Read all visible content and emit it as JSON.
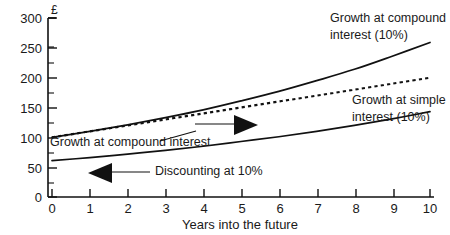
{
  "chart_data": {
    "type": "line",
    "title": "",
    "xlabel": "Years into the future",
    "ylabel": "£",
    "xlim": [
      0,
      10
    ],
    "ylim": [
      0,
      300
    ],
    "grid": false,
    "legend_position": "inline-annotations",
    "x": [
      0,
      1,
      2,
      3,
      4,
      5,
      6,
      7,
      8,
      9,
      10
    ],
    "xticks": [
      "0",
      "1",
      "2",
      "3",
      "4",
      "5",
      "6",
      "7",
      "8",
      "9",
      "10"
    ],
    "yticks": [
      "0",
      "50",
      "100",
      "150",
      "200",
      "250",
      "300"
    ],
    "ytick_values": [
      0,
      50,
      100,
      150,
      200,
      250,
      300
    ],
    "yminor_step": 25,
    "series": [
      {
        "name": "Growth at compound interest (10%)",
        "style": "solid",
        "values": [
          100,
          110,
          121,
          133,
          146,
          161,
          177,
          195,
          214,
          236,
          259
        ]
      },
      {
        "name": "Growth at simple interest (10%)",
        "style": "dotted",
        "values": [
          100,
          110,
          120,
          130,
          140,
          150,
          160,
          170,
          180,
          190,
          200
        ]
      },
      {
        "name": "Discounting at 10%",
        "style": "solid",
        "values": [
          61,
          66,
          72,
          78,
          85,
          93,
          101,
          110,
          120,
          131,
          143
        ]
      }
    ],
    "annotations": [
      {
        "id": "label-compound-right",
        "text_lines": [
          "Growth at compound",
          "interest (10%)"
        ],
        "x": 330,
        "y": 22
      },
      {
        "id": "label-simple-right",
        "text_lines": [
          "Growth at simple",
          "interest (10%)"
        ],
        "x": 352,
        "y": 104
      },
      {
        "id": "label-compound-left",
        "text": "Growth at compound interest",
        "x": 50,
        "y": 146
      },
      {
        "id": "label-discounting",
        "text": "Discounting at 10%",
        "x": 155,
        "y": 175
      }
    ],
    "direction_arrows": [
      {
        "id": "arrow-growth-right",
        "direction": "right"
      },
      {
        "id": "arrow-discount-left",
        "direction": "left"
      }
    ]
  },
  "axis": {
    "currency_symbol": "£",
    "x_title": "Years into the future"
  },
  "colors": {
    "ink": "#111111",
    "background": "#ffffff"
  }
}
